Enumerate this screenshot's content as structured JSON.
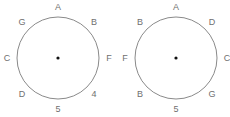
{
  "diagrams": [
    {
      "name": "left-circle",
      "labels": [
        {
          "text": "A",
          "position": "top"
        },
        {
          "text": "B",
          "position": "top-right"
        },
        {
          "text": "F",
          "position": "right"
        },
        {
          "text": "4",
          "position": "bottom-right"
        },
        {
          "text": "5",
          "position": "bottom"
        },
        {
          "text": "D",
          "position": "bottom-left"
        },
        {
          "text": "C",
          "position": "left"
        },
        {
          "text": "G",
          "position": "top-left"
        }
      ]
    },
    {
      "name": "right-circle",
      "labels": [
        {
          "text": "A",
          "position": "top"
        },
        {
          "text": "D",
          "position": "top-right"
        },
        {
          "text": "C",
          "position": "right"
        },
        {
          "text": "G",
          "position": "bottom-right"
        },
        {
          "text": "5",
          "position": "bottom"
        },
        {
          "text": "B",
          "position": "bottom-left"
        },
        {
          "text": "F",
          "position": "left"
        },
        {
          "text": "B",
          "position": "top-left"
        }
      ]
    }
  ]
}
